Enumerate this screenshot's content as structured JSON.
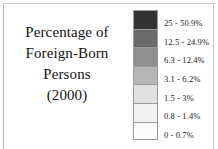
{
  "figure": {
    "title_lines": [
      "Percentage of",
      "Foreign-Born",
      "Persons",
      "(2000)"
    ],
    "title_text": "Percentage of Foreign-Born Persons (2000)",
    "year": "2000",
    "frame_color": "#c9c9c9",
    "text_color": "#131313",
    "background_color": "#ffffff"
  },
  "legend": {
    "classes": [
      {
        "label": "25 - 50.9%",
        "color": "#333333",
        "min": 25,
        "max": 50.9
      },
      {
        "label": "12.5 - 24.9%",
        "color": "#6a6a6a",
        "min": 12.5,
        "max": 24.9
      },
      {
        "label": "6.3 - 12.4%",
        "color": "#8f8f8f",
        "min": 6.3,
        "max": 12.4
      },
      {
        "label": "3.1 - 6.2%",
        "color": "#b5b5b5",
        "min": 3.1,
        "max": 6.2
      },
      {
        "label": "1.5 - 3%",
        "color": "#e0e0e0",
        "min": 1.5,
        "max": 3
      },
      {
        "label": "0.8 - 1.4%",
        "color": "#f1f1f1",
        "min": 0.8,
        "max": 1.4
      },
      {
        "label": "0 - 0.7%",
        "color": "#fbfbfb",
        "min": 0,
        "max": 0.7
      }
    ]
  }
}
